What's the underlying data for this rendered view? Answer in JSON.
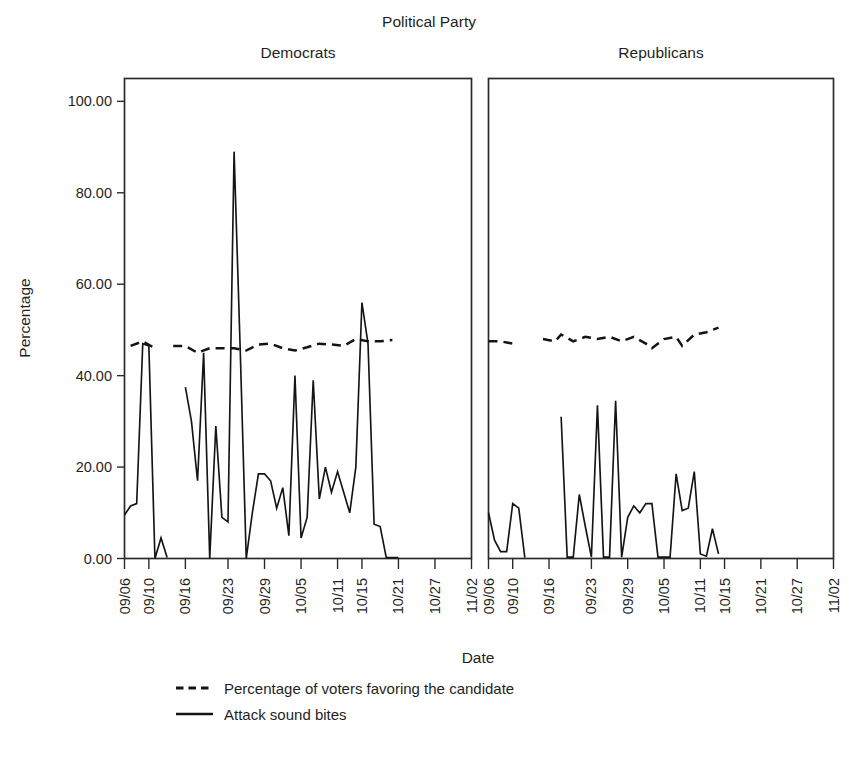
{
  "figure": {
    "title": "Political Party",
    "xlabel": "Date",
    "ylabel": "Percentage"
  },
  "panels": [
    {
      "label": "Democrats"
    },
    {
      "label": "Republicans"
    }
  ],
  "axes": {
    "y_ticks": [
      "0.00",
      "20.00",
      "40.00",
      "60.00",
      "80.00",
      "100.00"
    ],
    "x_ticks": [
      "09/06",
      "09/10",
      "09/16",
      "09/23",
      "09/29",
      "10/05",
      "10/11",
      "10/15",
      "10/21",
      "10/27",
      "11/02"
    ]
  },
  "legend": {
    "items": [
      {
        "label": "Percentage of voters favoring the candidate",
        "style": "dashed"
      },
      {
        "label": "Attack sound bites",
        "style": "solid"
      }
    ]
  },
  "chart_data": {
    "type": "line",
    "title": "Political Party",
    "xlabel": "Date",
    "ylabel": "Percentage",
    "ylim": [
      0,
      105
    ],
    "grid": false,
    "legend_position": "bottom-left",
    "facet_variable": "Political Party",
    "facets": [
      "Democrats",
      "Republicans"
    ],
    "x_tick_labels": [
      "09/06",
      "09/10",
      "09/16",
      "09/23",
      "09/29",
      "10/05",
      "10/11",
      "10/15",
      "10/21",
      "10/27",
      "11/02"
    ],
    "x_tick_positions": [
      0,
      4,
      10,
      17,
      23,
      29,
      35,
      39,
      45,
      51,
      57
    ],
    "x_range": [
      0,
      57
    ],
    "panel_series": [
      {
        "facet": "Democrats",
        "series": [
          {
            "name": "Attack sound bites",
            "style": "solid",
            "points": [
              {
                "x": 0,
                "y": 9.5
              },
              {
                "x": 1,
                "y": 11.5
              },
              {
                "x": 2,
                "y": 12.0
              },
              {
                "x": 3,
                "y": 47.0
              },
              {
                "x": 4,
                "y": 46.5
              },
              {
                "x": 5,
                "y": 0.0
              },
              {
                "x": 6,
                "y": 4.5
              },
              {
                "x": 7,
                "y": 0.2
              },
              {
                "x": 10,
                "y": 37.5
              },
              {
                "x": 11,
                "y": 30.0
              },
              {
                "x": 12,
                "y": 17.0
              },
              {
                "x": 13,
                "y": 45.0
              },
              {
                "x": 14,
                "y": 0.0
              },
              {
                "x": 15,
                "y": 29.0
              },
              {
                "x": 16,
                "y": 9.0
              },
              {
                "x": 17,
                "y": 8.0
              },
              {
                "x": 18,
                "y": 89.0
              },
              {
                "x": 19,
                "y": 46.0
              },
              {
                "x": 20,
                "y": 0.0
              },
              {
                "x": 21,
                "y": 10.0
              },
              {
                "x": 22,
                "y": 18.5
              },
              {
                "x": 23,
                "y": 18.5
              },
              {
                "x": 24,
                "y": 17.0
              },
              {
                "x": 25,
                "y": 11.0
              },
              {
                "x": 26,
                "y": 15.5
              },
              {
                "x": 27,
                "y": 5.0
              },
              {
                "x": 28,
                "y": 40.0
              },
              {
                "x": 29,
                "y": 4.5
              },
              {
                "x": 30,
                "y": 9.0
              },
              {
                "x": 31,
                "y": 39.0
              },
              {
                "x": 32,
                "y": 13.0
              },
              {
                "x": 33,
                "y": 20.0
              },
              {
                "x": 34,
                "y": 14.5
              },
              {
                "x": 35,
                "y": 19.0
              },
              {
                "x": 36,
                "y": 14.5
              },
              {
                "x": 37,
                "y": 10.0
              },
              {
                "x": 38,
                "y": 20.0
              },
              {
                "x": 39,
                "y": 56.0
              },
              {
                "x": 40,
                "y": 47.0
              },
              {
                "x": 41,
                "y": 7.5
              },
              {
                "x": 42,
                "y": 7.0
              },
              {
                "x": 43,
                "y": 0.2
              },
              {
                "x": 45,
                "y": 0.2
              }
            ]
          },
          {
            "name": "Percentage of voters favoring the candidate",
            "style": "dashed",
            "points": [
              {
                "x": 1,
                "y": 46.5
              },
              {
                "x": 3,
                "y": 47.5
              },
              {
                "x": 5,
                "y": 46.0
              },
              {
                "x": 8,
                "y": 46.5
              },
              {
                "x": 10,
                "y": 46.5
              },
              {
                "x": 12,
                "y": 45.0
              },
              {
                "x": 14,
                "y": 46.0
              },
              {
                "x": 16,
                "y": 46.0
              },
              {
                "x": 18,
                "y": 46.0
              },
              {
                "x": 20,
                "y": 45.5
              },
              {
                "x": 22,
                "y": 46.8
              },
              {
                "x": 24,
                "y": 47.0
              },
              {
                "x": 26,
                "y": 46.0
              },
              {
                "x": 28,
                "y": 45.5
              },
              {
                "x": 30,
                "y": 46.2
              },
              {
                "x": 32,
                "y": 47.0
              },
              {
                "x": 34,
                "y": 46.8
              },
              {
                "x": 36,
                "y": 46.5
              },
              {
                "x": 38,
                "y": 48.0
              },
              {
                "x": 40,
                "y": 47.5
              },
              {
                "x": 42,
                "y": 47.5
              },
              {
                "x": 44,
                "y": 47.8
              }
            ]
          }
        ]
      },
      {
        "facet": "Republicans",
        "series": [
          {
            "name": "Attack sound bites",
            "style": "solid",
            "points": [
              {
                "x": 0,
                "y": 10.0
              },
              {
                "x": 1,
                "y": 4.0
              },
              {
                "x": 2,
                "y": 1.5
              },
              {
                "x": 3,
                "y": 1.5
              },
              {
                "x": 4,
                "y": 12.0
              },
              {
                "x": 5,
                "y": 11.0
              },
              {
                "x": 6,
                "y": 0.2
              },
              {
                "x": 12,
                "y": 31.0
              },
              {
                "x": 13,
                "y": 0.3
              },
              {
                "x": 14,
                "y": 0.3
              },
              {
                "x": 15,
                "y": 14.0
              },
              {
                "x": 16,
                "y": 7.0
              },
              {
                "x": 17,
                "y": 0.3
              },
              {
                "x": 18,
                "y": 33.5
              },
              {
                "x": 19,
                "y": 0.3
              },
              {
                "x": 20,
                "y": 0.3
              },
              {
                "x": 21,
                "y": 34.5
              },
              {
                "x": 22,
                "y": 0.3
              },
              {
                "x": 23,
                "y": 9.0
              },
              {
                "x": 24,
                "y": 11.5
              },
              {
                "x": 25,
                "y": 10.0
              },
              {
                "x": 26,
                "y": 12.0
              },
              {
                "x": 27,
                "y": 12.0
              },
              {
                "x": 28,
                "y": 0.3
              },
              {
                "x": 29,
                "y": 0.3
              },
              {
                "x": 30,
                "y": 0.3
              },
              {
                "x": 31,
                "y": 18.5
              },
              {
                "x": 32,
                "y": 10.5
              },
              {
                "x": 33,
                "y": 11.0
              },
              {
                "x": 34,
                "y": 19.0
              },
              {
                "x": 35,
                "y": 1.0
              },
              {
                "x": 36,
                "y": 0.5
              },
              {
                "x": 37,
                "y": 6.5
              },
              {
                "x": 38,
                "y": 1.0
              }
            ]
          },
          {
            "name": "Percentage of voters favoring the candidate",
            "style": "dashed",
            "points": [
              {
                "x": 0,
                "y": 47.5
              },
              {
                "x": 2,
                "y": 47.5
              },
              {
                "x": 4,
                "y": 47.0
              },
              {
                "x": 9,
                "y": 48.0
              },
              {
                "x": 11,
                "y": 47.5
              },
              {
                "x": 12,
                "y": 49.0
              },
              {
                "x": 14,
                "y": 47.5
              },
              {
                "x": 16,
                "y": 48.5
              },
              {
                "x": 18,
                "y": 48.0
              },
              {
                "x": 20,
                "y": 48.5
              },
              {
                "x": 22,
                "y": 47.5
              },
              {
                "x": 24,
                "y": 48.5
              },
              {
                "x": 26,
                "y": 47.0
              },
              {
                "x": 27,
                "y": 46.0
              },
              {
                "x": 29,
                "y": 48.0
              },
              {
                "x": 31,
                "y": 48.5
              },
              {
                "x": 32,
                "y": 46.5
              },
              {
                "x": 34,
                "y": 49.0
              },
              {
                "x": 36,
                "y": 49.5
              },
              {
                "x": 38,
                "y": 50.5
              }
            ]
          }
        ]
      }
    ]
  }
}
